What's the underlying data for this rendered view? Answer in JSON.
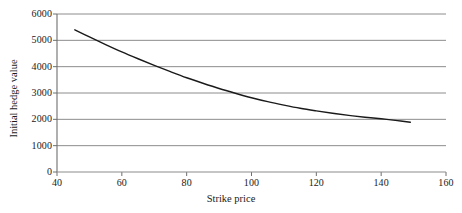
{
  "chart_data": {
    "type": "line",
    "title": "",
    "xlabel": "Strike price",
    "ylabel": "Initial hedge value",
    "xlim": [
      40,
      160
    ],
    "ylim": [
      0,
      6000
    ],
    "xticks": [
      40,
      60,
      80,
      100,
      120,
      140,
      160
    ],
    "xtick_labels": [
      "40",
      "60",
      "80",
      "100",
      "120",
      "140",
      "160"
    ],
    "yticks": [
      0,
      1000,
      2000,
      3000,
      4000,
      5000,
      6000
    ],
    "ytick_labels": [
      "0",
      "1000",
      "2000",
      "3000",
      "4000",
      "5000",
      "6000"
    ],
    "grid": "horizontal",
    "grid_color": "#8c8c8c",
    "legend": "none",
    "line_color": "#1a1a1a",
    "line_width": 1.4,
    "series": [
      {
        "name": "Initial hedge value",
        "x": [
          45.5,
          50,
          55,
          60,
          65,
          70,
          75,
          80,
          85,
          90,
          95,
          100,
          105,
          110,
          115,
          120,
          125,
          130,
          135,
          140,
          145,
          149
        ],
        "y": [
          5400,
          5130,
          4840,
          4560,
          4300,
          4050,
          3810,
          3580,
          3370,
          3170,
          2990,
          2820,
          2670,
          2540,
          2420,
          2320,
          2230,
          2150,
          2080,
          2020,
          1950,
          1890
        ]
      }
    ]
  },
  "axis_titles": {
    "x": "Strike price",
    "y": "Initial hedge value"
  }
}
